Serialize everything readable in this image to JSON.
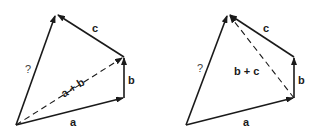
{
  "figure": {
    "diagrams": [
      {
        "id": "left",
        "vectors": [
          {
            "name": "a",
            "label": "a",
            "style": "solid"
          },
          {
            "name": "b",
            "label": "b",
            "style": "solid"
          },
          {
            "name": "c",
            "label": "c",
            "style": "solid"
          },
          {
            "name": "resultant",
            "label": "?",
            "style": "solid"
          },
          {
            "name": "partial-sum",
            "label": "a + b",
            "style": "dashed"
          }
        ]
      },
      {
        "id": "right",
        "vectors": [
          {
            "name": "a",
            "label": "a",
            "style": "solid"
          },
          {
            "name": "b",
            "label": "b",
            "style": "solid"
          },
          {
            "name": "c",
            "label": "c",
            "style": "solid"
          },
          {
            "name": "resultant",
            "label": "?",
            "style": "solid"
          },
          {
            "name": "partial-sum",
            "label": "b + c",
            "style": "dashed"
          }
        ]
      }
    ],
    "colors": {
      "stroke": "#1a1a1a",
      "background": "#ffffff"
    }
  }
}
